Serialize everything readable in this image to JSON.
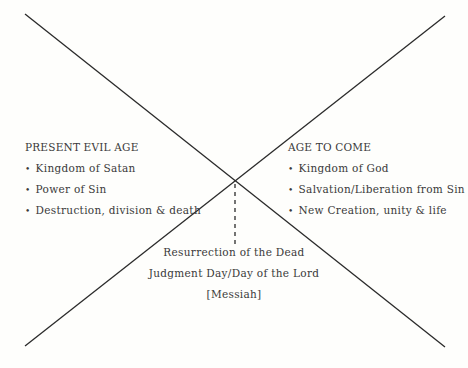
{
  "diagram": {
    "left": {
      "heading": "PRESENT EVIL AGE",
      "items": [
        "Kingdom of Satan",
        "Power of Sin",
        "Destruction, division & death"
      ]
    },
    "right": {
      "heading": "AGE TO COME",
      "items": [
        "Kingdom of God",
        "Salvation/Liberation from Sin",
        "New Creation, unity & life"
      ]
    },
    "bottom": {
      "lines": [
        "Resurrection of the Dead",
        "Judgment Day/Day of the Lord",
        "[Messiah]"
      ]
    },
    "colors": {
      "line": "#2a2a2a",
      "text": "#3a3a3a",
      "background": "#fefefc"
    }
  }
}
